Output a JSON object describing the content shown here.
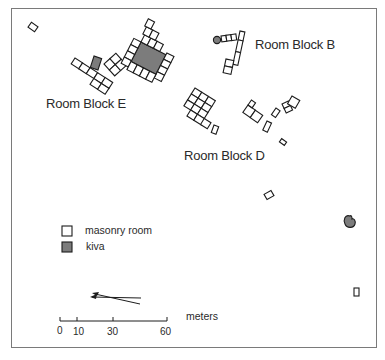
{
  "map": {
    "labels": {
      "block_b": "Room Block B",
      "block_e": "Room Block E",
      "block_d": "Room Block D"
    },
    "legend": {
      "items": [
        {
          "symbol": "masonry-room",
          "label": "masonry room",
          "fill": "#ffffff"
        },
        {
          "symbol": "kiva",
          "label": "kiva",
          "fill": "#7c7c7c"
        }
      ]
    },
    "scale_bar": {
      "unit": "meters",
      "ticks": [
        "0",
        "10",
        "30",
        "60"
      ]
    },
    "north_arrow": {
      "variants": [
        "true north",
        "magnetic north"
      ]
    },
    "colors": {
      "room_fill": "#ffffff",
      "kiva_fill": "#7c7c7c",
      "outline": "#1c1c1c",
      "frame": "#7a7a7a"
    }
  }
}
